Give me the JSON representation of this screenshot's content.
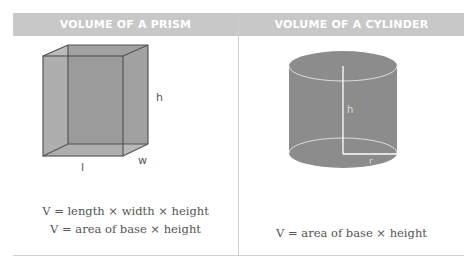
{
  "columns": [
    {
      "title": "VOLUME OF A PRISM",
      "shape": "rectangular-prism",
      "labels": {
        "height": "h",
        "length": "l",
        "width": "w"
      },
      "formulas": [
        "V = length × width × height",
        "V = area of base × height"
      ]
    },
    {
      "title": "VOLUME OF A CYLINDER",
      "shape": "cylinder",
      "labels": {
        "height": "h",
        "radius": "r"
      },
      "formulas": [
        "V = area of base × height"
      ]
    }
  ],
  "colors": {
    "header_bg": "#c8c8c8",
    "shape_fill": "#8c8c8c",
    "edge": "#555555",
    "text": "#555555"
  }
}
